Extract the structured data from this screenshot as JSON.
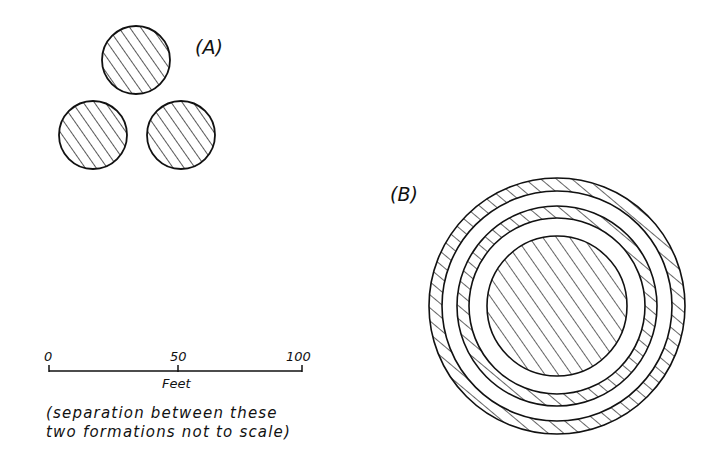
{
  "formation_a": {
    "label": "(A)",
    "circles": [
      {
        "name": "top",
        "cx": 136,
        "cy": 60,
        "r": 34
      },
      {
        "name": "bottom-left",
        "cx": 93,
        "cy": 135,
        "r": 34
      },
      {
        "name": "bottom-right",
        "cx": 181,
        "cy": 135,
        "r": 34
      }
    ]
  },
  "formation_b": {
    "label": "(B)",
    "center": {
      "cx": 557,
      "cy": 306
    },
    "outer_ring": {
      "r_outer": 128,
      "r_inner": 115
    },
    "middle_ring": {
      "r_outer": 100,
      "r_inner": 88
    },
    "inner_disk": {
      "r": 70
    }
  },
  "scale_bar": {
    "ticks": [
      "0",
      "50",
      "100"
    ],
    "unit": "Feet"
  },
  "note": {
    "line1": "(separation between these",
    "line2": "two formations not to scale)"
  },
  "colors": {
    "ink": "#111111",
    "paper": "#ffffff"
  }
}
